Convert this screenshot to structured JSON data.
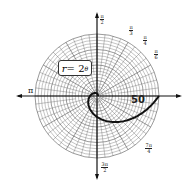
{
  "chart_data": {
    "type": "line",
    "coordinate_system": "polar",
    "title": "",
    "equation": "r = 2^θ",
    "series": [
      {
        "name": "r = 2^θ",
        "theta_range": [
          0,
          6.2832
        ],
        "formula": "r = 2^theta"
      }
    ],
    "angle_labels": [
      "π/2",
      "π/3",
      "π/4",
      "π/6",
      "π",
      "3π/2",
      "7π/4"
    ],
    "annotations": [
      "50"
    ],
    "r_max_gridline": 78,
    "grid": true
  },
  "labels": {
    "equation_r": "r",
    "equation_eq": " = 2",
    "equation_exp": "θ",
    "pi": "π",
    "half_pi_num": "π",
    "half_pi_den": "2",
    "third_pi_num": "π",
    "third_pi_den": "3",
    "quarter_pi_num": "π",
    "quarter_pi_den": "4",
    "sixth_pi_num": "π",
    "sixth_pi_den": "6",
    "three_half_num": "3π",
    "three_half_den": "2",
    "seven_quarter_num": "7π",
    "seven_quarter_den": "4",
    "fifty": "50"
  },
  "colors": {
    "grid": "#555555",
    "axis": "#111111",
    "curve": "#111111"
  }
}
